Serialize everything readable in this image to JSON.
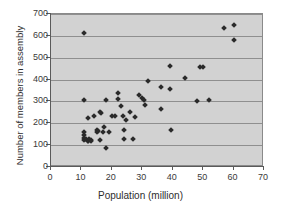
{
  "chart_data": {
    "type": "scatter",
    "title": "",
    "xlabel": "Population (million)",
    "ylabel": "Number of members in assembly",
    "xlim": [
      0,
      70
    ],
    "ylim": [
      0,
      700
    ],
    "xticks": [
      0,
      10,
      20,
      30,
      40,
      50,
      60,
      70
    ],
    "yticks": [
      0,
      100,
      200,
      300,
      400,
      500,
      600,
      700
    ],
    "grid": "horizontal",
    "legend": "none",
    "marker_color": "#2a2a2a",
    "plot_background": "#d2d2d2",
    "gridline_color": "#8f8f8f",
    "points": [
      [
        11,
        615
      ],
      [
        11,
        307
      ],
      [
        12,
        226
      ],
      [
        11,
        158
      ],
      [
        11,
        148
      ],
      [
        11,
        131
      ],
      [
        11,
        122
      ],
      [
        11.5,
        126
      ],
      [
        12,
        120
      ],
      [
        12,
        117
      ],
      [
        12.5,
        128
      ],
      [
        13,
        124
      ],
      [
        13,
        119
      ],
      [
        14,
        233
      ],
      [
        15,
        170
      ],
      [
        15,
        160
      ],
      [
        15.5,
        166
      ],
      [
        16,
        125
      ],
      [
        16,
        253
      ],
      [
        16.5,
        247
      ],
      [
        17,
        162
      ],
      [
        17.5,
        182
      ],
      [
        18,
        307
      ],
      [
        18,
        85
      ],
      [
        19,
        160
      ],
      [
        20,
        234
      ],
      [
        21,
        232
      ],
      [
        22,
        340
      ],
      [
        22,
        310
      ],
      [
        23,
        281
      ],
      [
        23.5,
        234
      ],
      [
        24,
        171
      ],
      [
        24,
        126
      ],
      [
        24.5,
        213
      ],
      [
        26,
        252
      ],
      [
        27,
        126
      ],
      [
        27.5,
        231
      ],
      [
        29,
        330
      ],
      [
        30,
        314
      ],
      [
        30.5,
        307
      ],
      [
        31,
        285
      ],
      [
        32,
        394
      ],
      [
        36,
        365
      ],
      [
        36,
        266
      ],
      [
        39,
        355
      ],
      [
        39,
        463
      ],
      [
        39.5,
        171
      ],
      [
        44,
        405
      ],
      [
        48,
        303
      ],
      [
        49,
        459
      ],
      [
        50,
        456
      ],
      [
        52,
        307
      ],
      [
        57,
        636
      ],
      [
        60,
        651
      ],
      [
        60,
        583
      ]
    ]
  }
}
